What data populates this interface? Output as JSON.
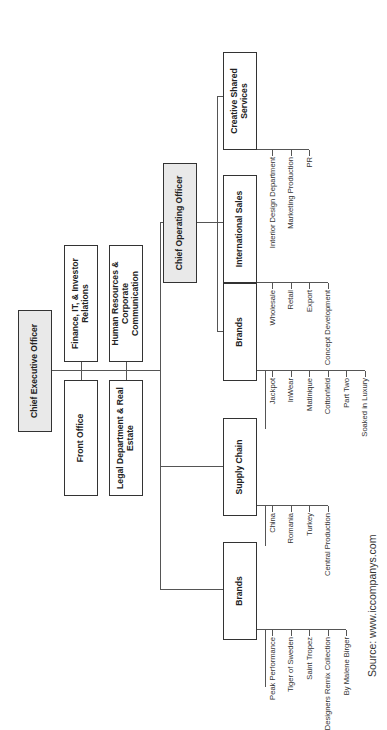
{
  "chart": {
    "ceo": "Chief Executive Officer",
    "staff": {
      "finance": "Finance, IT, & Investor Relations",
      "hr": "Human Resources & Corporate Communication",
      "front_office": "Front Office",
      "legal": "Legal Department & Real Estate"
    },
    "coo": "Chief Operating Officer",
    "divisions": [
      {
        "name": "Brands",
        "reports_to": "Chief Executive Officer",
        "items": [
          "Peak Performance",
          "Tiger of Sweden",
          "Saint Tropez",
          "Designers Remix Collection",
          "By Malene Birger"
        ]
      },
      {
        "name": "Supply Chain",
        "reports_to": "Chief Executive Officer",
        "items": [
          "China",
          "Romania",
          "Turkey",
          "Central Production"
        ]
      },
      {
        "name": "Brands",
        "reports_to": "Chief Operating Officer",
        "items": [
          "Jackpot",
          "InWear",
          "Matinique",
          "Cottonfield",
          "Part Two",
          "Soaked in Luxury"
        ]
      },
      {
        "name": "International Sales",
        "reports_to": "Chief Operating Officer",
        "items": [
          "Wholesale",
          "Retail",
          "Export",
          "Concept Development"
        ]
      },
      {
        "name": "Creative Shared Services",
        "reports_to": "Chief Operating Officer",
        "items": [
          "Interior Design Department",
          "Marketing Production",
          "PR"
        ]
      }
    ],
    "source": "Source: www.iccompanys.com"
  }
}
